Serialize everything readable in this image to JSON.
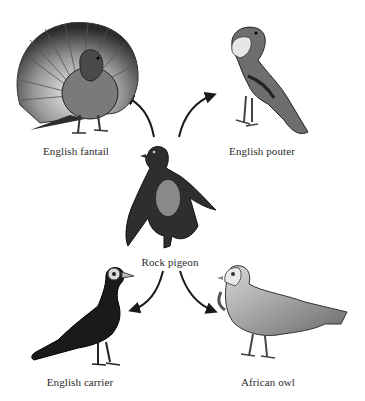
{
  "diagram": {
    "type": "ancestry-diagram",
    "center": {
      "id": "rock-pigeon",
      "label": "Rock pigeon"
    },
    "nodes": [
      {
        "id": "english-fantail",
        "label": "English fantail",
        "position": "top-left"
      },
      {
        "id": "english-pouter",
        "label": "English pouter",
        "position": "top-right"
      },
      {
        "id": "english-carrier",
        "label": "English carrier",
        "position": "bottom-left"
      },
      {
        "id": "african-owl",
        "label": "African owl",
        "position": "bottom-right"
      }
    ],
    "edges": [
      {
        "from": "rock-pigeon",
        "to": "english-fantail"
      },
      {
        "from": "rock-pigeon",
        "to": "english-pouter"
      },
      {
        "from": "rock-pigeon",
        "to": "english-carrier"
      },
      {
        "from": "rock-pigeon",
        "to": "african-owl"
      }
    ]
  },
  "labels": {
    "fantail": "English fantail",
    "pouter": "English pouter",
    "rock": "Rock pigeon",
    "carrier": "English carrier",
    "owl": "African owl"
  },
  "colors": {
    "background": "#ffffff",
    "ink": "#1a1a1a",
    "text": "#2a2a2a"
  }
}
